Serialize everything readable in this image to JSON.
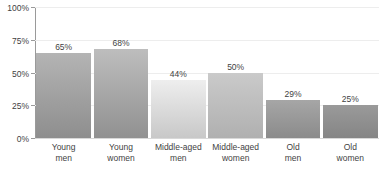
{
  "chart_data": {
    "type": "bar",
    "title": "",
    "subtitle": "",
    "xlabel": "",
    "ylabel": "",
    "ylim": [
      0,
      100
    ],
    "grid": true,
    "legend": "none",
    "y_ticks": [
      "0%",
      "25%",
      "50%",
      "75%",
      "100%"
    ],
    "y_tick_values": [
      0,
      25,
      50,
      75,
      100
    ],
    "categories": [
      "Young men",
      "Young women",
      "Middle-aged men",
      "Middle-aged women",
      "Old men",
      "Old women"
    ],
    "values": [
      65,
      68,
      44,
      50,
      29,
      25
    ],
    "data_labels": [
      "65%",
      "68%",
      "44%",
      "50%",
      "29%",
      "25%"
    ]
  },
  "axis": {
    "y_ticks": [
      {
        "label": "100%",
        "value": 100
      },
      {
        "label": "75%",
        "value": 75
      },
      {
        "label": "50%",
        "value": 50
      },
      {
        "label": "25%",
        "value": 25
      },
      {
        "label": "0%",
        "value": 0
      }
    ]
  },
  "bars": [
    {
      "category_line1": "Young",
      "category_line2": "men",
      "value": 65,
      "value_label": "65%",
      "color_top": "#b4b4b4",
      "color_bottom": "#8e8e8e"
    },
    {
      "category_line1": "Young",
      "category_line2": "women",
      "value": 68,
      "value_label": "68%",
      "color_top": "#bdbdbd",
      "color_bottom": "#919191"
    },
    {
      "category_line1": "Middle-aged",
      "category_line2": "men",
      "value": 44,
      "value_label": "44%",
      "color_top": "#eeeeee",
      "color_bottom": "#c8c8c8"
    },
    {
      "category_line1": "Middle-aged",
      "category_line2": "women",
      "value": 50,
      "value_label": "50%",
      "color_top": "#cacaca",
      "color_bottom": "#b0b0b0"
    },
    {
      "category_line1": "Old",
      "category_line2": "men",
      "value": 29,
      "value_label": "29%",
      "color_top": "#a6a6a6",
      "color_bottom": "#8b8b8b"
    },
    {
      "category_line1": "Old",
      "category_line2": "women",
      "value": 25,
      "value_label": "25%",
      "color_top": "#9a9a9a",
      "color_bottom": "#858585"
    }
  ],
  "colors": {
    "background": "#ffffff",
    "gridline": "#ededed",
    "axis_line": "#9a9a9a",
    "baseline": "#d8d8d8",
    "text": "#3f3f3f"
  }
}
